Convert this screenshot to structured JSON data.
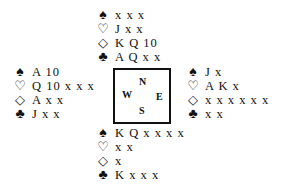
{
  "suits": {
    "spades": "♠",
    "hearts": "♡",
    "diamonds": "◇",
    "clubs": "♣"
  },
  "compass": {
    "north": "N",
    "west": "W",
    "east": "E",
    "south": "S"
  },
  "hands": {
    "north": {
      "spades": "x x x",
      "hearts": "J x x",
      "diamonds": "K Q 10",
      "clubs": "A Q x x"
    },
    "west": {
      "spades": "A 10",
      "hearts": "Q 10 x x x",
      "diamonds": "A x x",
      "clubs": "J x x"
    },
    "east": {
      "spades": "J x",
      "hearts": "A K x",
      "diamonds": "x x x x x x",
      "clubs": "x x"
    },
    "south": {
      "spades": "K Q x x x x",
      "hearts": "x x",
      "diamonds": "x",
      "clubs": "K x x x"
    }
  }
}
